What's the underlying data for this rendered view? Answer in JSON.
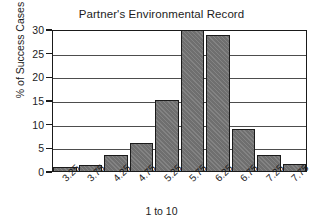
{
  "chart_data": {
    "type": "bar",
    "title": "Partner's Environmental Record",
    "xlabel": "1 to 10",
    "ylabel": "% of Success Cases",
    "categories": [
      "3.25",
      "3.75",
      "4.25",
      "4.75",
      "5.25",
      "5.75",
      "6.25",
      "6.75",
      "7.25",
      "7.75"
    ],
    "values": [
      1.0,
      1.5,
      3.6,
      6.2,
      15.3,
      30.0,
      29.0,
      9.0,
      3.7,
      1.7
    ],
    "ylim": [
      0,
      30
    ],
    "yticks": [
      0,
      5,
      10,
      15,
      20,
      25,
      30
    ],
    "ytick_labels": [
      "0",
      "5",
      "10",
      "15",
      "20",
      "25",
      "30"
    ],
    "grid": true,
    "legend": "none",
    "bar_color": "#757575",
    "bar_edge_color": "#1a1a1a",
    "grid_color": "#4d4d4d",
    "axis_color": "#1a1a1a",
    "background": "#ffffff"
  }
}
